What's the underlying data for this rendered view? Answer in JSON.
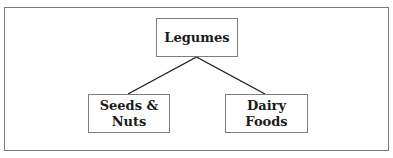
{
  "diagram": {
    "type": "tree",
    "root": {
      "label": "Legumes"
    },
    "children": [
      {
        "label": "Seeds &\nNuts"
      },
      {
        "label": "Dairy\nFoods"
      }
    ],
    "edges": [
      {
        "from": "Legumes",
        "to": "Seeds & Nuts"
      },
      {
        "from": "Legumes",
        "to": "Dairy Foods"
      }
    ]
  },
  "colors": {
    "border": "#7d7d7d",
    "line": "#1a1a1a",
    "text": "#1a1a1a",
    "background": "#ffffff"
  }
}
